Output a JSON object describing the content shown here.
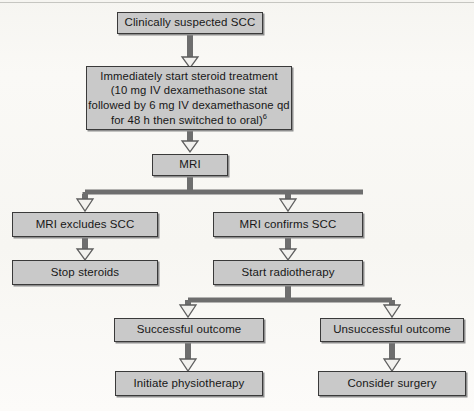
{
  "diagram": {
    "type": "clinical-flowchart",
    "orientation": "top-down",
    "colors": {
      "node_fill": "#c9c9c9",
      "node_border": "#3a3a3a",
      "connector": "#6e6e6e",
      "page_background": "#f7f6f3",
      "text": "#171717"
    },
    "nodes": [
      {
        "id": "suspected",
        "label": "Clinically suspected SCC",
        "level": 0
      },
      {
        "id": "steroids",
        "label": "Immediately start steroid treatment (10 mg IV dexamethasone stat followed by 6 mg IV dexamethasone qd for 48 h then switched to oral)",
        "lines": [
          "Immediately start steroid treatment",
          "(10 mg IV dexamethasone stat",
          "followed by 6 mg IV dexamethasone qd",
          "for 48 h then switched to oral)"
        ],
        "footnote_marker": "6",
        "level": 1
      },
      {
        "id": "mri",
        "label": "MRI",
        "level": 2
      },
      {
        "id": "mri-excludes",
        "label": "MRI excludes SCC",
        "level": 3,
        "branch": "left"
      },
      {
        "id": "mri-confirms",
        "label": "MRI confirms SCC",
        "level": 3,
        "branch": "right"
      },
      {
        "id": "stop-steroids",
        "label": "Stop steroids",
        "level": 4,
        "branch": "left"
      },
      {
        "id": "start-radiotherapy",
        "label": "Start radiotherapy",
        "level": 4,
        "branch": "right"
      },
      {
        "id": "successful",
        "label": "Successful outcome",
        "level": 5,
        "branch": "right-left"
      },
      {
        "id": "unsuccessful",
        "label": "Unsuccessful outcome",
        "level": 5,
        "branch": "right-right"
      },
      {
        "id": "physiotherapy",
        "label": "Initiate physiotherapy",
        "level": 6,
        "branch": "right-left"
      },
      {
        "id": "surgery",
        "label": "Consider surgery",
        "level": 6,
        "branch": "right-right"
      }
    ],
    "edges": [
      {
        "from": "suspected",
        "to": "steroids",
        "style": "arrow"
      },
      {
        "from": "steroids",
        "to": "mri",
        "style": "arrow"
      },
      {
        "from": "mri",
        "to": "mri-excludes",
        "style": "split-arrow"
      },
      {
        "from": "mri",
        "to": "mri-confirms",
        "style": "split-arrow"
      },
      {
        "from": "mri-excludes",
        "to": "stop-steroids",
        "style": "arrow"
      },
      {
        "from": "mri-confirms",
        "to": "start-radiotherapy",
        "style": "arrow"
      },
      {
        "from": "start-radiotherapy",
        "to": "successful",
        "style": "split-arrow"
      },
      {
        "from": "start-radiotherapy",
        "to": "unsuccessful",
        "style": "split-arrow"
      },
      {
        "from": "successful",
        "to": "physiotherapy",
        "style": "arrow"
      },
      {
        "from": "unsuccessful",
        "to": "surgery",
        "style": "arrow"
      }
    ]
  }
}
